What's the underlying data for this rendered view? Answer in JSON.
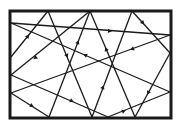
{
  "diagram": {
    "type": "billiard-trajectory",
    "colors": {
      "background": "#ffffff",
      "stroke": "#1a1a1a"
    },
    "frame": {
      "x": 10,
      "y": 11,
      "width": 161,
      "height": 107,
      "stroke_width": 3
    },
    "segments": [
      {
        "from": [
          11,
          23
        ],
        "to": [
          170,
          35
        ]
      },
      {
        "from": [
          48,
          11
        ],
        "to": [
          11,
          57
        ]
      },
      {
        "from": [
          90,
          11
        ],
        "to": [
          11,
          75
        ]
      },
      {
        "from": [
          48,
          11
        ],
        "to": [
          92,
          117
        ]
      },
      {
        "from": [
          90,
          11
        ],
        "to": [
          49,
          117
        ]
      },
      {
        "from": [
          11,
          23
        ],
        "to": [
          170,
          92
        ]
      },
      {
        "from": [
          132,
          11
        ],
        "to": [
          170,
          53
        ]
      },
      {
        "from": [
          90,
          11
        ],
        "to": [
          135,
          117
        ]
      },
      {
        "from": [
          132,
          11
        ],
        "to": [
          92,
          117
        ]
      },
      {
        "from": [
          170,
          35
        ],
        "to": [
          11,
          93
        ]
      },
      {
        "from": [
          11,
          75
        ],
        "to": [
          108,
          117
        ]
      },
      {
        "from": [
          11,
          93
        ],
        "to": [
          49,
          117
        ]
      },
      {
        "from": [
          108,
          117
        ],
        "to": [
          170,
          92
        ]
      },
      {
        "from": [
          170,
          53
        ],
        "to": [
          135,
          117
        ]
      }
    ],
    "arrows": [
      {
        "at": [
          110,
          31
        ],
        "dir": [
          1,
          0.075
        ]
      },
      {
        "at": [
          28,
          36
        ],
        "dir": [
          0.63,
          -0.78
        ]
      },
      {
        "at": [
          35,
          58
        ],
        "dir": [
          -0.77,
          0.64
        ]
      },
      {
        "at": [
          67,
          56
        ],
        "dir": [
          0.38,
          0.92
        ]
      },
      {
        "at": [
          78,
          42
        ],
        "dir": [
          0.36,
          -0.93
        ]
      },
      {
        "at": [
          85,
          55
        ],
        "dir": [
          -0.92,
          -0.4
        ]
      },
      {
        "at": [
          143,
          23
        ],
        "dir": [
          0.67,
          0.74
        ]
      },
      {
        "at": [
          106,
          49
        ],
        "dir": [
          -0.39,
          -0.92
        ]
      },
      {
        "at": [
          103,
          87
        ],
        "dir": [
          0.35,
          -0.94
        ]
      },
      {
        "at": [
          132,
          49
        ],
        "dir": [
          -0.94,
          0.34
        ]
      },
      {
        "at": [
          72,
          101
        ],
        "dir": [
          0.92,
          0.39
        ]
      },
      {
        "at": [
          32,
          106
        ],
        "dir": [
          0.85,
          0.53
        ]
      },
      {
        "at": [
          124,
          111
        ],
        "dir": [
          0.93,
          -0.37
        ]
      },
      {
        "at": [
          148,
          93
        ],
        "dir": [
          -0.48,
          0.88
        ]
      }
    ]
  }
}
